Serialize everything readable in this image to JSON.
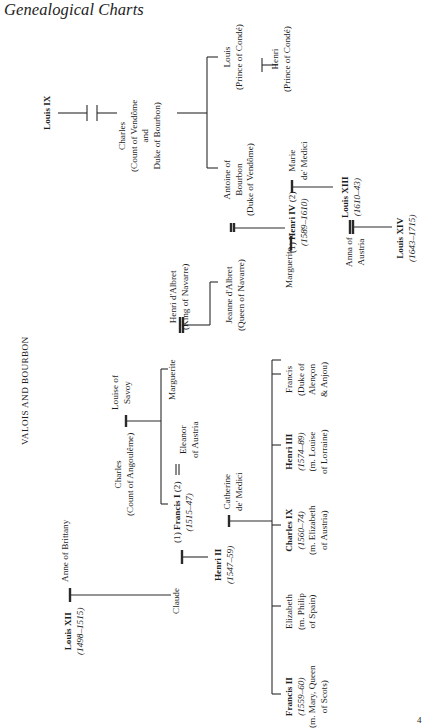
{
  "page": {
    "header": "Genealogical Charts",
    "section_title": "VALOIS AND BOURBON",
    "page_number": "4"
  },
  "people": {
    "louis_ix": {
      "name": "Louis IX"
    },
    "charles_vendome": {
      "name": "Charles",
      "title1": "(Count of Vendôme",
      "title2": "and",
      "title3": "Duke of Bourbon)"
    },
    "louis_conde": {
      "name": "Louis",
      "title": "(Prince of Condé)"
    },
    "henri_conde": {
      "name": "Henri",
      "title": "(Prince of Condé)"
    },
    "antoine": {
      "name1": "Antoine of",
      "name2": "Bourbon",
      "title": "(Duke of Vendôme)"
    },
    "marie_medici": {
      "name1": "Marie",
      "name2": "de' Medici"
    },
    "henri_iv": {
      "prefix": "(1)",
      "name": "Henri IV",
      "suffix": "(2)",
      "reign": "(1589–1610)"
    },
    "louis_xiii": {
      "name": "Louis XIII",
      "reign": "(1610–43)"
    },
    "anna_austria": {
      "name1": "Anna of",
      "name2": "Austria"
    },
    "louis_xiv": {
      "name": "Louis XIV",
      "reign": "(1643–1715)"
    },
    "henri_albret": {
      "name": "Henri d'Albret",
      "title": "(King of Navarre)"
    },
    "jeanne_albret": {
      "name": "Jeanne d'Albret",
      "title": "(Queen of Navarre)"
    },
    "louise_savoy": {
      "name1": "Louise of",
      "name2": "Savoy"
    },
    "charles_angouleme": {
      "name": "Charles",
      "title": "(Count of Angoulême)"
    },
    "marguerite_1": {
      "name": "Marguerite"
    },
    "eleanor": {
      "name1": "Eleanor",
      "name2": "of Austria"
    },
    "francis_i": {
      "prefix": "(1)",
      "name": "Francis I",
      "suffix": "(2)",
      "reign": "(1515–47)"
    },
    "louis_xii": {
      "name": "Louis XII",
      "reign": "(1498–1515)"
    },
    "anne_brittany": {
      "name": "Anne of Brittany"
    },
    "claude": {
      "name": "Claude"
    },
    "henri_ii": {
      "name": "Henri II",
      "reign": "(1547–59)"
    },
    "catherine": {
      "name1": "Catherine",
      "name2": "de' Medici"
    },
    "francis_ii": {
      "name": "Francis II",
      "reign": "(1559–60)",
      "spouse1": "(m. Mary, Queen",
      "spouse2": "of Scots)"
    },
    "elizabeth": {
      "name": "Elizabeth",
      "spouse1": "(m. Philip",
      "spouse2": "of Spain)"
    },
    "charles_ix": {
      "name": "Charles IX",
      "reign": "(1560–74)",
      "spouse1": "(m. Elizabeth",
      "spouse2": "of Austria)"
    },
    "henri_iii": {
      "name": "Henri III",
      "reign": "(1574–89)",
      "spouse1": "(m. Louise",
      "spouse2": "of Lorraine)"
    },
    "francis_alencon": {
      "name": "Francis",
      "title1": "(Duke of",
      "title2": "Alençon",
      "title3": "& Anjou)"
    },
    "marguerite_2": {
      "name": "Marguerite"
    },
    "henri_iv_marriage_prefix": {
      "label": "(1)"
    }
  }
}
